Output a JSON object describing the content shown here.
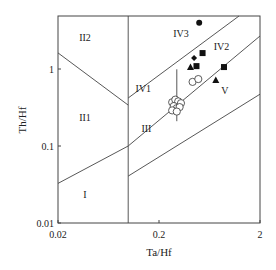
{
  "chart_data": {
    "type": "scatter",
    "title": "",
    "xlabel": "Ta/Hf",
    "ylabel": "Th/Hf",
    "xscale": "log",
    "yscale": "log",
    "xlim": [
      0.02,
      2
    ],
    "ylim": [
      0.01,
      5
    ],
    "x_ticks": [
      {
        "value": 0.02,
        "label": "0.02"
      },
      {
        "value": 0.2,
        "label": "0.2"
      },
      {
        "value": 2,
        "label": "2"
      }
    ],
    "y_ticks": [
      {
        "value": 0.01,
        "label": "0.01"
      },
      {
        "value": 0.1,
        "label": "0.1"
      },
      {
        "value": 1,
        "label": "1"
      }
    ],
    "grid": false,
    "legend": null,
    "field_boundaries": [
      {
        "name": "II2-II1",
        "points": [
          [
            0.02,
            1.62
          ],
          [
            0.099,
            0.34
          ]
        ]
      },
      {
        "name": "upper-diagonal",
        "points": [
          [
            0.099,
            0.42
          ],
          [
            1.24,
            5.0
          ]
        ]
      },
      {
        "name": "middle-diagonal",
        "points": [
          [
            0.02,
            0.0327
          ],
          [
            0.099,
            0.1
          ],
          [
            2,
            2.68
          ]
        ]
      },
      {
        "name": "lower-diagonal",
        "points": [
          [
            0.099,
            0.0407
          ],
          [
            2,
            0.47
          ]
        ]
      },
      {
        "name": "vertical-0.1",
        "points": [
          [
            0.099,
            0.01
          ],
          [
            0.099,
            5.0
          ]
        ]
      },
      {
        "name": "vertical-0.3",
        "points": [
          [
            0.3,
            0.99
          ],
          [
            0.3,
            0.21
          ]
        ]
      }
    ],
    "field_labels": [
      {
        "text": "II2",
        "x": 0.037,
        "y": 2.3
      },
      {
        "text": "II1",
        "x": 0.037,
        "y": 0.21
      },
      {
        "text": "I",
        "x": 0.037,
        "y": 0.021
      },
      {
        "text": "IV3",
        "x": 0.33,
        "y": 2.6
      },
      {
        "text": "IV2",
        "x": 0.83,
        "y": 1.75
      },
      {
        "text": "IV1",
        "x": 0.14,
        "y": 0.5
      },
      {
        "text": "III",
        "x": 0.15,
        "y": 0.15
      },
      {
        "text": "V",
        "x": 0.9,
        "y": 0.48
      }
    ],
    "series": [
      {
        "name": "filled-circle",
        "marker": "circle-filled",
        "points": [
          [
            0.5,
            4.0
          ]
        ]
      },
      {
        "name": "filled-square",
        "marker": "square",
        "points": [
          [
            0.54,
            1.61
          ],
          [
            0.47,
            1.09
          ],
          [
            0.88,
            1.06
          ]
        ]
      },
      {
        "name": "filled-diamond",
        "marker": "diamond",
        "points": [
          [
            0.445,
            1.39
          ]
        ]
      },
      {
        "name": "filled-triangle",
        "marker": "triangle",
        "points": [
          [
            0.41,
            1.06
          ],
          [
            0.73,
            0.72
          ]
        ]
      },
      {
        "name": "open-circle",
        "marker": "circle-open",
        "points": [
          [
            0.43,
            0.68
          ],
          [
            0.49,
            0.74
          ],
          [
            0.27,
            0.37
          ],
          [
            0.29,
            0.4
          ],
          [
            0.31,
            0.38
          ],
          [
            0.33,
            0.36
          ],
          [
            0.28,
            0.33
          ],
          [
            0.3,
            0.31
          ],
          [
            0.32,
            0.32
          ],
          [
            0.27,
            0.29
          ],
          [
            0.3,
            0.28
          ]
        ]
      }
    ]
  }
}
